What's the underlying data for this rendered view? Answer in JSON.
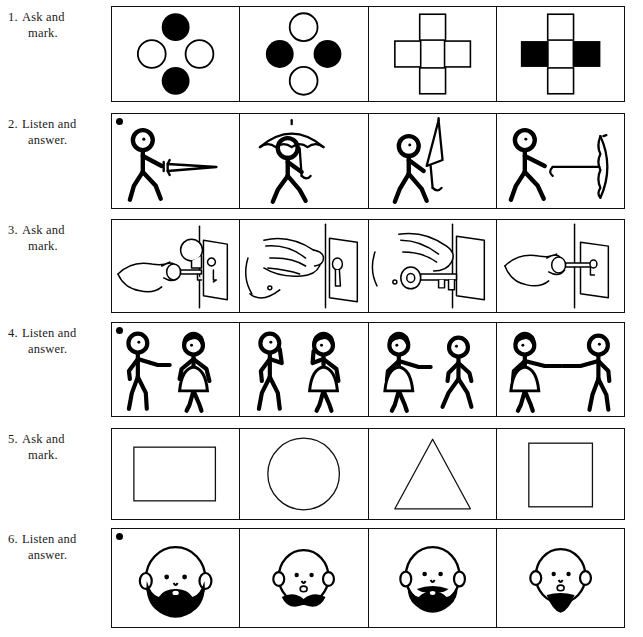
{
  "page": {
    "background_color": "#ffffff",
    "ink_color": "#111111"
  },
  "exercises": [
    {
      "number": "1.",
      "instruction_line1": "Ask and",
      "instruction_line2": "mark.",
      "instruction_full": "Ask and mark.",
      "has_bullet": false,
      "panels": [
        {
          "kind": "dots-cross",
          "shape": "circle",
          "filled": [
            "top",
            "bottom"
          ],
          "open": [
            "left",
            "right"
          ]
        },
        {
          "kind": "dots-cross",
          "shape": "circle",
          "filled": [
            "left",
            "right"
          ],
          "open": [
            "top",
            "bottom"
          ]
        },
        {
          "kind": "dots-cross",
          "shape": "square",
          "filled": [],
          "open": [
            "top",
            "bottom",
            "left",
            "right"
          ]
        },
        {
          "kind": "dots-cross",
          "shape": "square",
          "filled": [
            "left",
            "right"
          ],
          "open": [
            "top",
            "bottom"
          ]
        }
      ]
    },
    {
      "number": "2.",
      "instruction_line1": "Listen and",
      "instruction_line2": "answer.",
      "instruction_full": "Listen and answer.",
      "has_bullet": true,
      "panels": [
        {
          "kind": "umbrella-figure",
          "pose": "closed-forward"
        },
        {
          "kind": "umbrella-figure",
          "pose": "open-overhead"
        },
        {
          "kind": "umbrella-figure",
          "pose": "closed-up"
        },
        {
          "kind": "umbrella-figure",
          "pose": "open-sideways"
        }
      ]
    },
    {
      "number": "3.",
      "instruction_line1": "Ask and",
      "instruction_line2": "mark.",
      "instruction_full": "Ask and mark.",
      "has_bullet": false,
      "panels": [
        {
          "kind": "hand-key",
          "pose": "key-in-lock-knob-above"
        },
        {
          "kind": "hand-key",
          "pose": "fist-on-knob"
        },
        {
          "kind": "hand-key",
          "pose": "hand-with-large-key"
        },
        {
          "kind": "hand-key",
          "pose": "key-into-keyhole"
        }
      ]
    },
    {
      "number": "4.",
      "instruction_line1": "Listen and",
      "instruction_line2": "answer.",
      "instruction_full": "Listen and answer.",
      "has_bullet": true,
      "panels": [
        {
          "kind": "two-figures",
          "left": "man-pointing",
          "right": "woman-standing"
        },
        {
          "kind": "two-figures",
          "left": "man-hand-to-ear",
          "right": "woman-hand-to-ear"
        },
        {
          "kind": "two-figures",
          "left": "woman-pointing",
          "right": "man-walking"
        },
        {
          "kind": "two-figures",
          "left": "woman-pointing",
          "right": "man-pointing"
        }
      ]
    },
    {
      "number": "5.",
      "instruction_line1": "Ask and",
      "instruction_line2": "mark.",
      "instruction_full": "Ask and mark.",
      "has_bullet": false,
      "panels": [
        {
          "kind": "shape",
          "shape": "rectangle"
        },
        {
          "kind": "shape",
          "shape": "circle"
        },
        {
          "kind": "shape",
          "shape": "triangle"
        },
        {
          "kind": "shape",
          "shape": "square"
        }
      ]
    },
    {
      "number": "6.",
      "instruction_line1": "Listen and",
      "instruction_line2": "answer.",
      "instruction_full": "Listen and answer.",
      "has_bullet": true,
      "panels": [
        {
          "kind": "face",
          "beard": "full-beard-large"
        },
        {
          "kind": "face",
          "beard": "mustache-goatee-small"
        },
        {
          "kind": "face",
          "beard": "beard-and-mustache"
        },
        {
          "kind": "face",
          "beard": "goatee-triangle"
        }
      ]
    }
  ]
}
